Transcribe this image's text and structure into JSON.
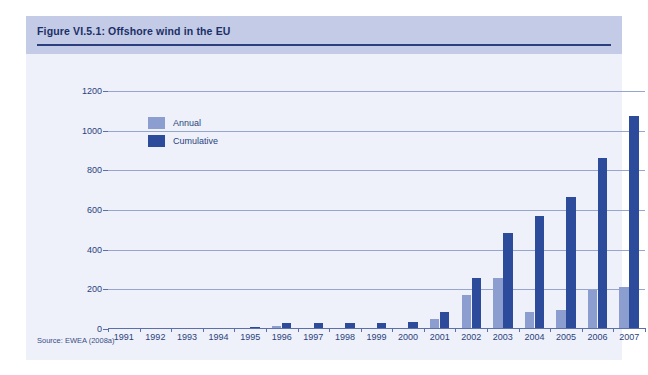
{
  "figure": {
    "title": "Figure VI.5.1: Offshore wind in the EU",
    "source": "Source: EWEA (2008a)"
  },
  "chart_data": {
    "type": "bar",
    "title": "Figure VI.5.1: Offshore wind in the EU",
    "xlabel": "",
    "ylabel": "",
    "ylim": [
      0,
      1200
    ],
    "yticks": [
      0,
      200,
      400,
      600,
      800,
      1000,
      1200
    ],
    "ytick_labels": [
      "0",
      "200",
      "400",
      "600",
      "800",
      "1000",
      "1200"
    ],
    "grid": true,
    "legend_position": "upper-left-inside",
    "categories": [
      "1991",
      "1992",
      "1993",
      "1994",
      "1995",
      "1996",
      "1997",
      "1998",
      "1999",
      "2000",
      "2001",
      "2002",
      "2003",
      "2004",
      "2005",
      "2006",
      "2007"
    ],
    "series": [
      {
        "name": "Annual",
        "color": "#8c9ed0",
        "values": [
          5,
          0,
          0,
          2,
          5,
          17,
          0,
          0,
          0,
          4,
          51,
          170,
          256,
          86,
          96,
          196,
          210
        ]
      },
      {
        "name": "Cumulative",
        "color": "#2c4b9b",
        "values": [
          5,
          5,
          5,
          7,
          12,
          29,
          29,
          29,
          29,
          36,
          86,
          256,
          485,
          571,
          667,
          863,
          1073
        ]
      }
    ]
  }
}
